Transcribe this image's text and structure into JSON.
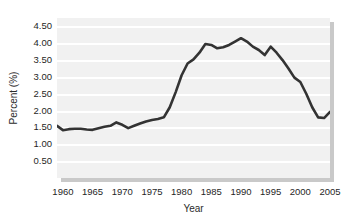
{
  "chart_data": {
    "type": "line",
    "title": "",
    "xlabel": "Year",
    "ylabel": "Percent (%)",
    "xlim": [
      1959,
      2005
    ],
    "ylim": [
      0,
      4.75
    ],
    "grid": true,
    "legend": "none",
    "line_color": "#333333",
    "plot_background": "#f1f1f1",
    "gridline_color": "#ffffff",
    "y_ticks": [
      "0.50",
      "1.00",
      "1.50",
      "2.00",
      "2.50",
      "3.00",
      "3.50",
      "4.00",
      "4.50"
    ],
    "y_tick_values": [
      0.5,
      1.0,
      1.5,
      2.0,
      2.5,
      3.0,
      3.5,
      4.0,
      4.5
    ],
    "x_ticks": [
      "1960",
      "1965",
      "1970",
      "1975",
      "1980",
      "1985",
      "1990",
      "1995",
      "2000",
      "2005"
    ],
    "x_tick_values": [
      1960,
      1965,
      1970,
      1975,
      1980,
      1985,
      1990,
      1995,
      2000,
      2005
    ],
    "series": [
      {
        "name": "Percent",
        "x": [
          1959,
          1960,
          1961,
          1962,
          1963,
          1964,
          1965,
          1966,
          1967,
          1968,
          1969,
          1970,
          1971,
          1972,
          1973,
          1974,
          1975,
          1976,
          1977,
          1978,
          1979,
          1980,
          1981,
          1982,
          1983,
          1984,
          1985,
          1986,
          1987,
          1988,
          1989,
          1990,
          1991,
          1992,
          1993,
          1994,
          1995,
          1996,
          1997,
          1998,
          1999,
          2000,
          2001,
          2002,
          2003,
          2004,
          2005
        ],
        "values": [
          1.55,
          1.42,
          1.45,
          1.46,
          1.46,
          1.44,
          1.43,
          1.48,
          1.52,
          1.55,
          1.65,
          1.58,
          1.48,
          1.55,
          1.62,
          1.68,
          1.72,
          1.75,
          1.8,
          2.1,
          2.55,
          3.05,
          3.4,
          3.52,
          3.72,
          3.98,
          3.95,
          3.85,
          3.88,
          3.95,
          4.05,
          4.15,
          4.05,
          3.9,
          3.8,
          3.65,
          3.9,
          3.72,
          3.5,
          3.25,
          2.98,
          2.85,
          2.5,
          2.1,
          1.8,
          1.78,
          1.96
        ]
      }
    ]
  },
  "axes": {
    "y_title": "Percent (%)",
    "x_title": "Year"
  }
}
